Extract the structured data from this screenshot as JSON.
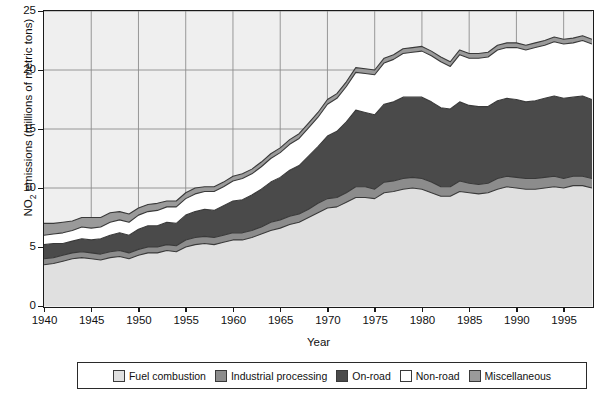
{
  "chart_data": {
    "type": "area",
    "stacked": true,
    "title": "",
    "xlabel": "Year",
    "ylabel": "NO2 emissions (millions of metric tons)",
    "ylabel_base": "NO",
    "ylabel_sub": "2",
    "ylabel_rest": " emissions (millions of metric tons)",
    "xlim": [
      1940,
      1998
    ],
    "ylim": [
      0,
      25
    ],
    "yticks": [
      0,
      5,
      10,
      15,
      20,
      25
    ],
    "xticks": [
      1940,
      1945,
      1950,
      1955,
      1960,
      1965,
      1970,
      1975,
      1980,
      1985,
      1990,
      1995
    ],
    "grid": "both-major",
    "legend_position": "below-plot",
    "x": [
      1940,
      1941,
      1942,
      1943,
      1944,
      1945,
      1946,
      1947,
      1948,
      1949,
      1950,
      1951,
      1952,
      1953,
      1954,
      1955,
      1956,
      1957,
      1958,
      1959,
      1960,
      1961,
      1962,
      1963,
      1964,
      1965,
      1966,
      1967,
      1968,
      1969,
      1970,
      1971,
      1972,
      1973,
      1974,
      1975,
      1976,
      1977,
      1978,
      1979,
      1980,
      1981,
      1982,
      1983,
      1984,
      1985,
      1986,
      1987,
      1988,
      1989,
      1990,
      1991,
      1992,
      1993,
      1994,
      1995,
      1996,
      1997,
      1998
    ],
    "series": [
      {
        "name": "Fuel combustion",
        "color": "#e0e0e0",
        "values": [
          3.5,
          3.6,
          3.8,
          4.0,
          4.1,
          4.0,
          3.9,
          4.1,
          4.2,
          4.0,
          4.3,
          4.5,
          4.5,
          4.7,
          4.6,
          5.0,
          5.2,
          5.3,
          5.2,
          5.4,
          5.6,
          5.6,
          5.8,
          6.1,
          6.4,
          6.6,
          6.9,
          7.1,
          7.5,
          7.9,
          8.3,
          8.4,
          8.8,
          9.2,
          9.2,
          9.1,
          9.6,
          9.7,
          9.9,
          10.0,
          9.9,
          9.6,
          9.3,
          9.3,
          9.7,
          9.6,
          9.5,
          9.6,
          9.9,
          10.1,
          10.0,
          9.9,
          9.9,
          10.0,
          10.1,
          10.0,
          10.2,
          10.2,
          10.0
        ]
      },
      {
        "name": "Industrial processing",
        "color": "#8c8c8c",
        "values": [
          0.5,
          0.5,
          0.5,
          0.5,
          0.5,
          0.5,
          0.5,
          0.5,
          0.5,
          0.5,
          0.5,
          0.5,
          0.5,
          0.5,
          0.5,
          0.6,
          0.6,
          0.6,
          0.6,
          0.6,
          0.6,
          0.6,
          0.6,
          0.6,
          0.7,
          0.7,
          0.7,
          0.7,
          0.7,
          0.8,
          0.8,
          0.8,
          0.8,
          0.9,
          0.9,
          0.8,
          0.9,
          0.9,
          0.9,
          0.9,
          0.9,
          0.9,
          0.8,
          0.8,
          0.9,
          0.8,
          0.8,
          0.8,
          0.9,
          0.9,
          0.9,
          0.9,
          0.9,
          0.9,
          0.9,
          0.8,
          0.8,
          0.8,
          0.8
        ]
      },
      {
        "name": "On-road",
        "color": "#4a4a4a",
        "values": [
          1.2,
          1.2,
          1.0,
          1.0,
          1.1,
          1.1,
          1.3,
          1.4,
          1.5,
          1.5,
          1.7,
          1.8,
          1.8,
          1.9,
          1.9,
          2.1,
          2.2,
          2.3,
          2.3,
          2.5,
          2.7,
          2.8,
          3.0,
          3.2,
          3.4,
          3.6,
          3.9,
          4.1,
          4.5,
          4.8,
          5.3,
          5.6,
          6.0,
          6.5,
          6.3,
          6.3,
          6.6,
          6.7,
          6.9,
          6.8,
          6.9,
          6.8,
          6.7,
          6.6,
          6.7,
          6.6,
          6.6,
          6.5,
          6.6,
          6.6,
          6.6,
          6.5,
          6.6,
          6.7,
          6.8,
          6.8,
          6.7,
          6.8,
          6.7
        ]
      },
      {
        "name": "Non-road",
        "color": "#ffffff",
        "values": [
          0.8,
          0.8,
          0.9,
          0.9,
          1.0,
          1.0,
          1.0,
          1.1,
          1.1,
          1.1,
          1.2,
          1.2,
          1.3,
          1.3,
          1.4,
          1.4,
          1.5,
          1.5,
          1.6,
          1.6,
          1.7,
          1.8,
          1.8,
          1.9,
          2.0,
          2.1,
          2.2,
          2.3,
          2.4,
          2.5,
          2.7,
          2.8,
          3.0,
          3.2,
          3.3,
          3.4,
          3.5,
          3.6,
          3.7,
          3.8,
          3.9,
          3.9,
          3.9,
          3.6,
          4.0,
          4.0,
          4.1,
          4.2,
          4.3,
          4.3,
          4.4,
          4.4,
          4.5,
          4.5,
          4.6,
          4.6,
          4.6,
          4.7,
          4.7
        ]
      },
      {
        "name": "Miscellaneous",
        "color": "#9a9a9a",
        "values": [
          1.0,
          0.9,
          0.9,
          0.8,
          0.8,
          0.9,
          0.8,
          0.8,
          0.7,
          0.7,
          0.6,
          0.6,
          0.6,
          0.5,
          0.5,
          0.5,
          0.5,
          0.4,
          0.4,
          0.4,
          0.4,
          0.4,
          0.4,
          0.4,
          0.4,
          0.4,
          0.4,
          0.4,
          0.4,
          0.4,
          0.4,
          0.4,
          0.4,
          0.4,
          0.4,
          0.4,
          0.4,
          0.4,
          0.4,
          0.4,
          0.4,
          0.4,
          0.4,
          0.4,
          0.4,
          0.4,
          0.4,
          0.4,
          0.4,
          0.4,
          0.4,
          0.4,
          0.4,
          0.4,
          0.4,
          0.4,
          0.4,
          0.4,
          0.4
        ]
      }
    ],
    "totals": [
      7.0,
      7.0,
      7.1,
      7.2,
      7.5,
      7.5,
      7.5,
      7.9,
      8.0,
      7.8,
      8.3,
      8.6,
      8.7,
      8.9,
      8.9,
      9.6,
      10.0,
      10.1,
      10.1,
      10.5,
      11.0,
      11.2,
      11.6,
      12.2,
      12.9,
      13.4,
      14.1,
      14.6,
      15.5,
      16.4,
      17.5,
      18.0,
      19.0,
      20.2,
      20.1,
      20.0,
      21.0,
      21.3,
      21.8,
      21.9,
      22.0,
      21.6,
      21.1,
      20.7,
      21.7,
      21.4,
      21.4,
      21.5,
      22.1,
      22.3,
      22.3,
      22.1,
      22.3,
      22.5,
      22.8,
      22.6,
      22.7,
      22.9,
      22.6
    ]
  },
  "legend": {
    "items": [
      {
        "label": "Fuel combustion",
        "color": "#e0e0e0"
      },
      {
        "label": "Industrial processing",
        "color": "#8c8c8c"
      },
      {
        "label": "On-road",
        "color": "#4a4a4a"
      },
      {
        "label": "Non-road",
        "color": "#ffffff"
      },
      {
        "label": "Miscellaneous",
        "color": "#9a9a9a"
      }
    ]
  },
  "axes": {
    "x_title": "Year",
    "y_tick_labels": [
      "0",
      "5",
      "10",
      "15",
      "20",
      "25"
    ],
    "x_tick_labels": [
      "1940",
      "1945",
      "1950",
      "1955",
      "1960",
      "1965",
      "1970",
      "1975",
      "1980",
      "1985",
      "1990",
      "1995"
    ]
  }
}
